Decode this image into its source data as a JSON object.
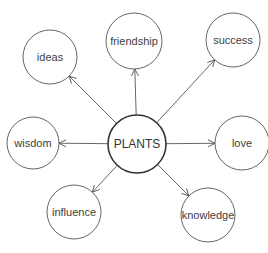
{
  "diagram": {
    "type": "mind-map",
    "center": {
      "label": "PLANTS",
      "cx": 137,
      "cy": 144,
      "r": 29,
      "stroke_width": 1.6
    },
    "nodes": [
      {
        "label": "ideas",
        "cx": 50,
        "cy": 57,
        "r": 27
      },
      {
        "label": "friendship",
        "cx": 134,
        "cy": 41,
        "r": 28
      },
      {
        "label": "success",
        "cx": 233,
        "cy": 40,
        "r": 27
      },
      {
        "label": "wisdom",
        "cx": 33,
        "cy": 143,
        "r": 26
      },
      {
        "label": "love",
        "cx": 242,
        "cy": 143,
        "r": 27
      },
      {
        "label": "influence",
        "cx": 74,
        "cy": 212,
        "r": 27
      },
      {
        "label": "knowledge",
        "cx": 208,
        "cy": 215,
        "r": 27
      }
    ],
    "edges": [
      {
        "from": "PLANTS",
        "to": "ideas"
      },
      {
        "from": "PLANTS",
        "to": "friendship"
      },
      {
        "from": "PLANTS",
        "to": "success"
      },
      {
        "from": "PLANTS",
        "to": "wisdom"
      },
      {
        "from": "PLANTS",
        "to": "love"
      },
      {
        "from": "PLANTS",
        "to": "influence"
      },
      {
        "from": "PLANTS",
        "to": "knowledge"
      }
    ],
    "colors": {
      "stroke": "#555555",
      "text": "#404040",
      "background": "#ffffff"
    }
  }
}
